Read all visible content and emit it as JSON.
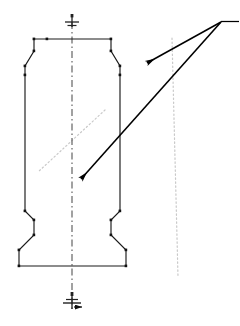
{
  "drawing": {
    "title": "Symmetrical machined part outline with section leaders",
    "canvas": {
      "width": 240,
      "height": 326,
      "background": "#ffffff"
    },
    "colors": {
      "outline": "#1a1a1a",
      "centerline": "#555555",
      "section_line": "#c9c9c9",
      "leader": "#000000",
      "vertex_marker": "#111111"
    },
    "part_outline": {
      "name": "part-profile",
      "stroke_width": 1.1,
      "points": "61,39 99,39 111,51 111,66 120,75 120,211 111,220 111,235 126,250 126,266 19,266 19,250 34,235 34,220 25,211 25,75 34,66 34,51 47,39 61,39",
      "vertices": [
        {
          "x": 47,
          "y": 39
        },
        {
          "x": 111,
          "y": 51
        },
        {
          "x": 120,
          "y": 75
        },
        {
          "x": 120,
          "y": 211
        },
        {
          "x": 111,
          "y": 220
        },
        {
          "x": 126,
          "y": 250
        },
        {
          "x": 126,
          "y": 266
        },
        {
          "x": 19,
          "y": 266
        },
        {
          "x": 19,
          "y": 250
        },
        {
          "x": 34,
          "y": 220
        },
        {
          "x": 25,
          "y": 211
        },
        {
          "x": 25,
          "y": 75
        },
        {
          "x": 34,
          "y": 51
        }
      ]
    },
    "centerline": {
      "name": "vertical-centerline",
      "x": 72,
      "y_top": 22,
      "y_bottom": 310,
      "dash_pattern": "7,3,1.5,3"
    },
    "datum_top": {
      "name": "datum-symbol-top",
      "x": 72,
      "y": 20,
      "tick_long_half": 7,
      "tick_short_half": 4,
      "stem_top": 14,
      "stem_bottom": 27,
      "dot_y": 16
    },
    "datum_bottom": {
      "name": "datum-symbol-bottom",
      "x": 72,
      "y": 303,
      "tick_long_half": 8,
      "tick_short_half": 4,
      "stem_top": 293,
      "stem_bottom": 309,
      "arrow_tip_x": 85,
      "arrow_y": 306
    },
    "section_lines": [
      {
        "name": "section-line-long",
        "x1": 172,
        "y1": 38,
        "x2": 178,
        "y2": 277,
        "note": "descends left-to-right through part, dotted light gray"
      },
      {
        "name": "section-line-short",
        "x1": 105,
        "y1": 110,
        "x2": 38,
        "y2": 172,
        "note": "short dotted diagonal crossing the long one"
      }
    ],
    "leaders": [
      {
        "name": "leader-upper",
        "from_x": 222,
        "from_y": 22,
        "to_x": 147,
        "to_y": 63,
        "arrow": "down-left"
      },
      {
        "name": "leader-lower",
        "from_x": 222,
        "from_y": 22,
        "to_x": 81,
        "to_y": 179,
        "arrow": "down-left"
      }
    ],
    "leader_shelf": {
      "name": "leader-shelf",
      "x1": 222,
      "y1": 22,
      "x2": 238,
      "y2": 22
    }
  }
}
